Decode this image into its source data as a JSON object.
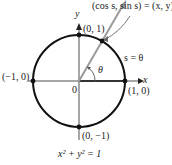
{
  "diagram": {
    "equation": "x² + y² = 1",
    "axes": {
      "x_label": "x",
      "y_label": "y",
      "origin_label": "0"
    },
    "points": [
      {
        "label": "(0, 1)"
      },
      {
        "label": "(−1, 0)"
      },
      {
        "label": "(1, 0)"
      },
      {
        "label": "(0, −1)"
      }
    ],
    "annotation": "(cos s, sin s) = (x, y)",
    "arc_label": "s = θ",
    "angle_label": "θ",
    "colors": {
      "circle": "#111111",
      "axes": "#888888",
      "ray": "#999999",
      "highlight_axis": "#333333"
    }
  }
}
